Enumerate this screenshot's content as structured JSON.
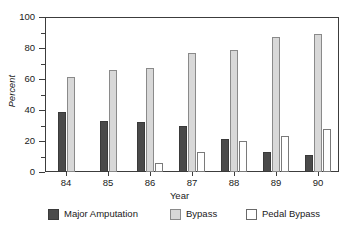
{
  "chart_data": {
    "type": "bar",
    "title": "",
    "subtitle": "",
    "xlabel": "Year",
    "ylabel": "Percent",
    "categories": [
      "84",
      "85",
      "86",
      "87",
      "88",
      "89",
      "90"
    ],
    "ylim": [
      0,
      100
    ],
    "yticks": [
      0,
      20,
      40,
      60,
      80,
      100
    ],
    "ytick_labels": [
      "0",
      "20",
      "40",
      "60",
      "80",
      "100"
    ],
    "yminor_ticks": [
      10,
      30,
      50,
      70,
      90
    ],
    "grid": false,
    "legend_position": "below",
    "grouping": "grouped",
    "series": [
      {
        "name": "Major Amputation",
        "color": "#4a4a4a",
        "values": [
          39,
          33,
          32,
          30,
          21,
          13,
          11
        ]
      },
      {
        "name": "Bypass",
        "color": "#d8d8d8",
        "values": [
          61,
          66,
          67,
          77,
          79,
          87,
          89
        ]
      },
      {
        "name": "Pedal Bypass",
        "color": "#ffffff",
        "values": [
          0,
          0,
          6,
          13,
          20,
          23,
          28
        ]
      }
    ]
  },
  "axes": {
    "ylabel": "Percent",
    "xlabel": "Year"
  },
  "legend": {
    "items": [
      {
        "label": "Major Amputation",
        "swatch": "amp"
      },
      {
        "label": "Bypass",
        "swatch": "bypass"
      },
      {
        "label": "Pedal Bypass",
        "swatch": "pedal"
      }
    ]
  }
}
